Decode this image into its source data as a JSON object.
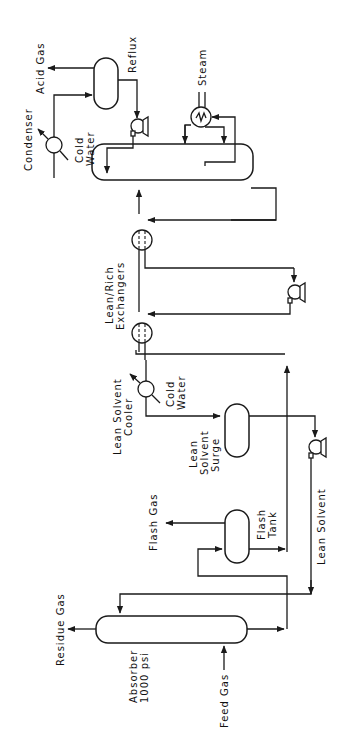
{
  "diagram": {
    "type": "process-flow-diagram",
    "orientation": "rotated-90-ccw",
    "colors": {
      "line": "#1a1a1a",
      "background": "#ffffff",
      "text": "#111111"
    },
    "labels": {
      "acid_gas": "Acid Gas",
      "reflux": "Reflux",
      "condenser": "Condenser",
      "cold_water_1": "Cold",
      "cold_water_2": "Water",
      "steam": "Steam",
      "lean_rich_1": "Lean/Rich",
      "lean_rich_2": "Exchangers",
      "lean_solvent_cooler_1": "Lean Solvent",
      "lean_solvent_cooler_2": "Cooler",
      "cooler_cold_1": "Cold",
      "cooler_cold_2": "Water",
      "surge_1": "Lean",
      "surge_2": "Solvent",
      "surge_3": "Surge",
      "flash_gas": "Flash Gas",
      "flash_tank_1": "Flash",
      "flash_tank_2": "Tank",
      "lean_solvent": "Lean Solvent",
      "residue_gas": "Residue Gas",
      "absorber_1": "Absorber",
      "absorber_2": "1000 psi",
      "feed_gas": "Feed Gas"
    },
    "equipment": [
      {
        "id": "absorber",
        "kind": "column",
        "label": "Absorber 1000 psi"
      },
      {
        "id": "flash-tank",
        "kind": "vessel",
        "label": "Flash Tank"
      },
      {
        "id": "lean-solvent-surge",
        "kind": "vessel",
        "label": "Lean Solvent Surge"
      },
      {
        "id": "lean-solvent-cooler",
        "kind": "heat-exchanger",
        "label": "Lean Solvent Cooler"
      },
      {
        "id": "lean-rich-exchangers",
        "kind": "heat-exchanger",
        "count": 2,
        "label": "Lean/Rich Exchangers"
      },
      {
        "id": "stripper",
        "kind": "column",
        "label": ""
      },
      {
        "id": "reboiler",
        "kind": "heat-exchanger",
        "label": "Steam"
      },
      {
        "id": "condenser",
        "kind": "heat-exchanger",
        "label": "Condenser"
      },
      {
        "id": "reflux-drum",
        "kind": "vessel",
        "label": "Reflux"
      },
      {
        "id": "pumps",
        "kind": "pump",
        "count": 3
      }
    ],
    "streams": [
      "Feed Gas",
      "Residue Gas",
      "Flash Gas",
      "Lean Solvent",
      "Acid Gas",
      "Steam",
      "Cold Water"
    ]
  }
}
